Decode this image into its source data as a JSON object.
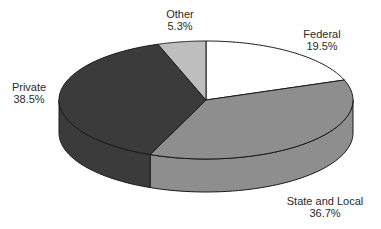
{
  "chart_data": {
    "type": "pie",
    "style": "3d",
    "title": "",
    "start_angle_deg": 0,
    "direction": "clockwise",
    "slices": [
      {
        "label": "Federal",
        "value": 19.5,
        "display": "19.5%",
        "color": "#ffffff"
      },
      {
        "label": "State and Local",
        "value": 36.7,
        "display": "36.7%",
        "color": "#8e8e8e"
      },
      {
        "label": "Private",
        "value": 38.5,
        "display": "38.5%",
        "color": "#3b3b3b"
      },
      {
        "label": "Other",
        "value": 5.3,
        "display": "5.3%",
        "color": "#bebebe"
      }
    ],
    "legend": "none",
    "labels_position": "outside"
  },
  "geometry": {
    "cx": 206,
    "cy": 100,
    "rx": 147,
    "ry": 59,
    "depth": 33
  },
  "labels": [
    {
      "name": "Federal",
      "pct": "19.5%",
      "x": 322,
      "y": 28
    },
    {
      "name": "State and Local",
      "pct": "36.7%",
      "x": 325,
      "y": 195
    },
    {
      "name": "Private",
      "pct": "38.5%",
      "x": 29,
      "y": 81
    },
    {
      "name": "Other",
      "pct": "5.3%",
      "x": 180,
      "y": 8
    }
  ]
}
